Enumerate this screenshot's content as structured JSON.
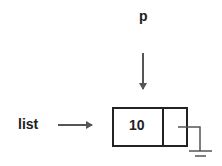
{
  "diagram": {
    "type": "linked-list-node",
    "pointer_p_label": "p",
    "list_label": "list",
    "node": {
      "data_value": "10",
      "next": "null (ground symbol)"
    },
    "colors": {
      "stroke": "#222222",
      "arrow": "#555555"
    }
  }
}
